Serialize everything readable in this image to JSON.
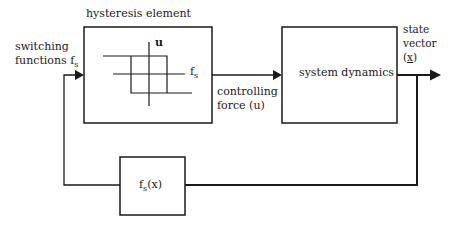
{
  "diagram": {
    "type": "control-loop-block-diagram",
    "blocks": {
      "hysteresis": {
        "title": "hysteresis element",
        "axis_vertical_label": "u",
        "axis_horizontal_label_main": "f",
        "axis_horizontal_label_sub": "s"
      },
      "system": {
        "label": "system dynamics"
      },
      "feedback": {
        "label_main": "f",
        "label_sub": "s",
        "label_rest": "(x)"
      }
    },
    "signals": {
      "input": {
        "line1": "switching",
        "line2_main": "functions f",
        "line2_sub": "s"
      },
      "control": {
        "line1": "controlling",
        "line2": "force (u)"
      },
      "output": {
        "line1": "state",
        "line2": "vector",
        "line3_open": "(",
        "line3_var": "x",
        "line3_close": ")"
      }
    },
    "colors": {
      "line": "#1a1a1a",
      "background": "#ffffff"
    }
  }
}
